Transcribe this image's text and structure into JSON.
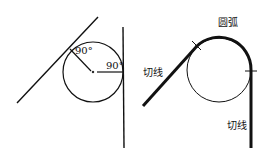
{
  "left_figure": {
    "angle_label_1": "90°",
    "angle_label_2": "90°"
  },
  "right_figure": {
    "arc_label": "圆弧",
    "tangent_label_left": "切线",
    "tangent_label_right": "切线"
  },
  "colors": {
    "stroke": "#111111",
    "background": "#ffffff"
  }
}
